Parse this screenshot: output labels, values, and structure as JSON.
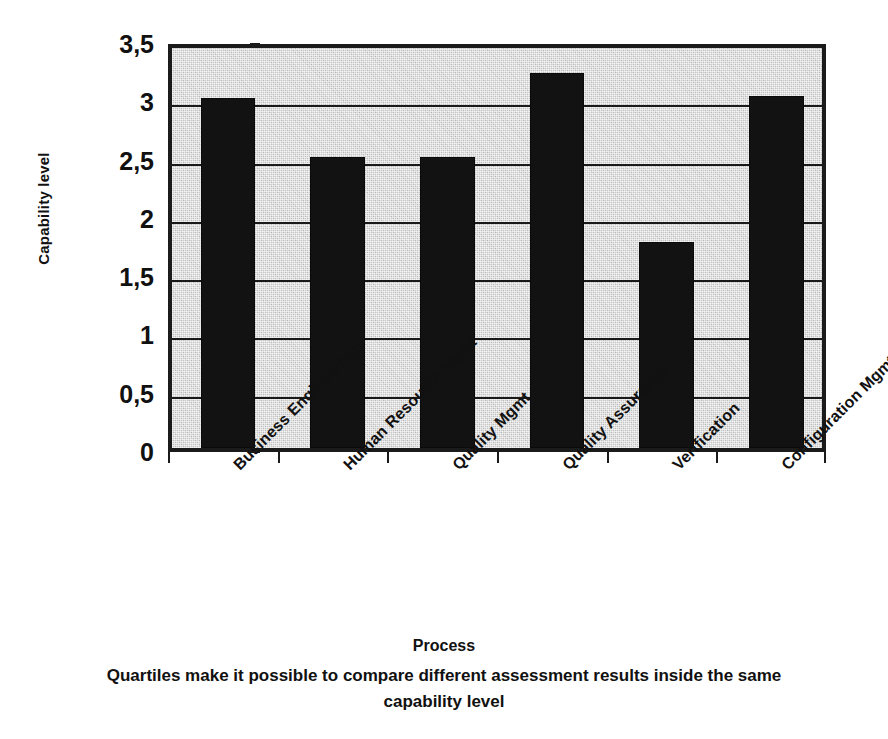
{
  "chart_data": {
    "type": "bar",
    "title": "",
    "subtitle": "",
    "xlabel": "Process",
    "ylabel": "Capability level",
    "categories": [
      "Business Engineering",
      "Human Resource Mgmt",
      "Quality Mgmt",
      "Quality Assurance",
      "Verification",
      "Configuration Mgmt"
    ],
    "values": [
      3.0,
      2.5,
      2.5,
      3.22,
      1.77,
      3.02
    ],
    "ylim": [
      0,
      3.5
    ],
    "ytick_values": [
      0,
      0.5,
      1,
      1.5,
      2,
      2.5,
      3,
      3.5
    ],
    "ytick_labels": [
      "0",
      "0,5",
      "1",
      "1,5",
      "2",
      "2,5",
      "3",
      "3,5"
    ],
    "grid": true,
    "grid_axis": "y",
    "legend": false,
    "legend_position": "none",
    "bar_color": "#121212",
    "plot_background": "#c9c9c9",
    "axis_color": "#1b1b1b",
    "decimal_separator": ",",
    "annotations": []
  },
  "caption": {
    "line1": "Quartiles make it possible to compare different assessment results inside the same",
    "line2": "capability level"
  }
}
